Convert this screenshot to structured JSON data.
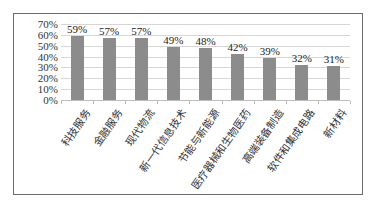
{
  "chart_data": {
    "type": "bar",
    "title": "",
    "xlabel": "",
    "ylabel": "",
    "categories": [
      "科技服务",
      "金融服务",
      "现代物流",
      "新一代信息技术",
      "节能与新能源",
      "医疗器械和生物医药",
      "高端装备制造",
      "软件和集成电路",
      "新材料"
    ],
    "values": [
      59,
      57,
      57,
      49,
      48,
      42,
      39,
      32,
      31
    ],
    "value_labels": [
      "59%",
      "57%",
      "57%",
      "49%",
      "48%",
      "42%",
      "39%",
      "32%",
      "31%"
    ],
    "ylim": [
      0,
      70
    ],
    "yticks": [
      "0%",
      "10%",
      "20%",
      "30%",
      "40%",
      "50%",
      "60%",
      "70%"
    ],
    "grid": true,
    "legend": null,
    "bar_color": "#8c8c8c",
    "unit": "%"
  }
}
